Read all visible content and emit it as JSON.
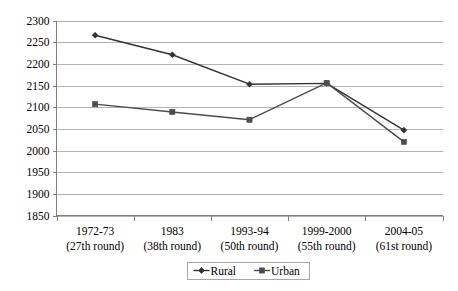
{
  "chart_data": {
    "type": "line",
    "title": "",
    "subtitle": "",
    "xlabel": "",
    "ylabel": "",
    "ylim": [
      1850,
      2300
    ],
    "ytick_step": 50,
    "yticks": [
      1850,
      1900,
      1950,
      2000,
      2050,
      2100,
      2150,
      2200,
      2250,
      2300
    ],
    "ytick_labels": [
      "1850",
      "1900",
      "1950",
      "2000",
      "2050",
      "2100",
      "2150",
      "2200",
      "2250",
      "2300"
    ],
    "categories": [
      "1972-73",
      "1983",
      "1993-94",
      "1999-2000",
      "2004-05"
    ],
    "category_sublabels": [
      "(27th round)",
      "(38th round)",
      "(50th round)",
      "(55th round)",
      "(61st round)"
    ],
    "x_tick_labels": [
      [
        "1972-73",
        "(27th round)"
      ],
      [
        "1983",
        "(38th round)"
      ],
      [
        "1993-94",
        "(50th round)"
      ],
      [
        "1999-2000",
        "(55th round)"
      ],
      [
        "2004-05",
        "(61st round)"
      ]
    ],
    "series": [
      {
        "name": "Rural",
        "color": "#333333",
        "marker": "diamond",
        "values": [
          2266,
          2221,
          2153,
          2155,
          2047
        ]
      },
      {
        "name": "Urban",
        "color": "#4d4d4d",
        "marker": "square",
        "values": [
          2107,
          2089,
          2071,
          2156,
          2020
        ]
      }
    ],
    "grid": true,
    "grid_axis": "y",
    "legend_position": "bottom",
    "legend_entries": [
      "Rural",
      "Urban"
    ],
    "annotations": []
  },
  "colors": {
    "background": "#ffffff",
    "gridline": "#b3b3b3",
    "axis": "#808080",
    "text": "#000000",
    "rural": "#333333",
    "urban": "#4d4d4d",
    "legend_border": "#a6a6a6"
  }
}
